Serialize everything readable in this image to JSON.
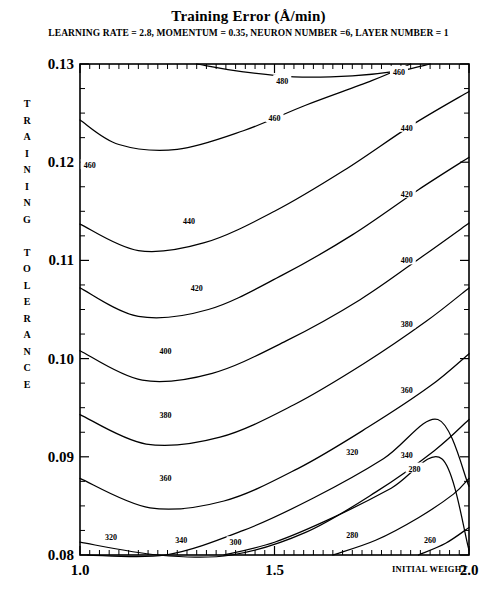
{
  "figure": {
    "title": "Training Error (Å/min)",
    "subtitle": "LEARNING RATE = 2.8, MOMENTUM = 0.35, NEURON NUMBER =6, LAYER NUMBER = 1",
    "ylabel_stacked": "T\nR\nA\nI\nN\nI\nN\nG\n \nT\nO\nL\nE\nR\nA\nN\nC\nE",
    "xaxis_name": "INITIAL WEIGHT"
  },
  "axes": {
    "x_ticklabels": [
      "1.0",
      "1.5",
      "2.0"
    ],
    "x_tickvalues": [
      1.0,
      1.5,
      2.0
    ],
    "y_ticklabels": [
      "0.08",
      "0.09",
      "0.10",
      "0.11",
      "0.12",
      "0.13"
    ],
    "y_tickvalues": [
      0.08,
      0.09,
      0.1,
      0.11,
      0.12,
      0.13
    ]
  },
  "chart_data": {
    "type": "line",
    "subtype": "contour",
    "title": "Training Error (Å/min)",
    "subtitle": "LEARNING RATE = 2.8, MOMENTUM = 0.35, NEURON NUMBER =6, LAYER NUMBER = 1",
    "xlabel": "INITIAL WEIGHT",
    "ylabel": "TRAINING TOLERANCE",
    "xlim": [
      1.0,
      2.0
    ],
    "ylim": [
      0.08,
      0.13
    ],
    "grid": false,
    "legend": "none",
    "contour_interval": 20,
    "contour_levels": [
      260,
      280,
      300,
      320,
      340,
      360,
      380,
      400,
      420,
      440,
      460,
      480
    ],
    "zunits": "Å/min",
    "contours": [
      {
        "level": 480,
        "label": "480",
        "label_xy": [
          1.52,
          0.1283
        ],
        "points": [
          [
            1.3,
            0.13
          ],
          [
            1.42,
            0.1292
          ],
          [
            1.55,
            0.1287
          ],
          [
            1.7,
            0.1288
          ],
          [
            1.82,
            0.1293
          ],
          [
            1.9,
            0.13
          ]
        ]
      },
      {
        "level": 460,
        "label_left": "460",
        "label_left_xy": [
          1.025,
          0.1197
        ],
        "label_mid": "460",
        "label_mid_xy": [
          1.5,
          0.1245
        ],
        "label_right": "460",
        "label_right_xy": [
          1.82,
          0.1292
        ],
        "points": [
          [
            1.0,
            0.1243
          ],
          [
            1.1,
            0.1218
          ],
          [
            1.25,
            0.1213
          ],
          [
            1.42,
            0.1232
          ],
          [
            1.58,
            0.1258
          ],
          [
            1.75,
            0.1283
          ],
          [
            1.85,
            0.13
          ]
        ]
      },
      {
        "level": 440,
        "label_left": "440",
        "label_left_xy": [
          1.28,
          0.114
        ],
        "label_right": "440",
        "label_right_xy": [
          1.84,
          0.1235
        ],
        "points": [
          [
            1.0,
            0.1137
          ],
          [
            1.15,
            0.111
          ],
          [
            1.32,
            0.1118
          ],
          [
            1.5,
            0.115
          ],
          [
            1.68,
            0.1192
          ],
          [
            1.85,
            0.1237
          ],
          [
            2.0,
            0.1272
          ]
        ]
      },
      {
        "level": 420,
        "label_left": "420",
        "label_left_xy": [
          1.3,
          0.1072
        ],
        "label_right": "420",
        "label_right_xy": [
          1.84,
          0.1168
        ],
        "points": [
          [
            1.0,
            0.1072
          ],
          [
            1.15,
            0.1043
          ],
          [
            1.33,
            0.105
          ],
          [
            1.52,
            0.1085
          ],
          [
            1.7,
            0.1126
          ],
          [
            1.87,
            0.1172
          ],
          [
            2.0,
            0.1205
          ]
        ]
      },
      {
        "level": 400,
        "label_left": "400",
        "label_left_xy": [
          1.22,
          0.1008
        ],
        "label_right": "400",
        "label_right_xy": [
          1.84,
          0.11
        ],
        "points": [
          [
            1.0,
            0.1008
          ],
          [
            1.16,
            0.0978
          ],
          [
            1.34,
            0.0985
          ],
          [
            1.53,
            0.1018
          ],
          [
            1.72,
            0.106
          ],
          [
            1.88,
            0.1104
          ],
          [
            2.0,
            0.1138
          ]
        ]
      },
      {
        "level": 380,
        "label_left": "380",
        "label_left_xy": [
          1.22,
          0.0943
        ],
        "label_right": "380",
        "label_right_xy": [
          1.84,
          0.1035
        ],
        "points": [
          [
            1.0,
            0.0943
          ],
          [
            1.17,
            0.0913
          ],
          [
            1.36,
            0.092
          ],
          [
            1.55,
            0.0953
          ],
          [
            1.73,
            0.0995
          ],
          [
            1.89,
            0.1038
          ],
          [
            2.0,
            0.1072
          ]
        ]
      },
      {
        "level": 360,
        "label_left": "360",
        "label_left_xy": [
          1.22,
          0.0878
        ],
        "label_right": "360",
        "label_right_xy": [
          1.84,
          0.0968
        ],
        "points": [
          [
            1.0,
            0.0878
          ],
          [
            1.18,
            0.0848
          ],
          [
            1.37,
            0.0855
          ],
          [
            1.56,
            0.0888
          ],
          [
            1.74,
            0.093
          ],
          [
            1.9,
            0.0972
          ],
          [
            2.0,
            0.1005
          ]
        ]
      },
      {
        "level": 340,
        "label_left": "340",
        "label_left_xy": [
          1.26,
          0.0815
        ],
        "label_right": "340",
        "label_right_xy": [
          1.84,
          0.0902
        ],
        "points": [
          [
            1.0,
            0.0813
          ],
          [
            1.2,
            0.0783
          ],
          [
            1.39,
            0.079
          ],
          [
            1.58,
            0.0823
          ],
          [
            1.76,
            0.0864
          ],
          [
            1.91,
            0.0906
          ],
          [
            2.0,
            0.0938
          ]
        ]
      },
      {
        "level": 320,
        "label_left": "320",
        "label_left_xy": [
          1.08,
          0.0818
        ],
        "label_right": "320",
        "label_right_xy": [
          1.7,
          0.0905
        ],
        "points": [
          [
            1.02,
            0.08
          ],
          [
            1.22,
            0.0795
          ],
          [
            1.42,
            0.0825
          ],
          [
            1.6,
            0.0858
          ],
          [
            1.78,
            0.0898
          ],
          [
            1.92,
            0.0938
          ],
          [
            2.0,
            0.087
          ]
        ]
      },
      {
        "level": 300,
        "label": "300",
        "label_xy": [
          1.4,
          0.0813
        ],
        "points": [
          [
            1.37,
            0.08
          ],
          [
            1.5,
            0.0813
          ],
          [
            1.65,
            0.0838
          ],
          [
            1.8,
            0.0868
          ],
          [
            1.93,
            0.0898
          ],
          [
            2.0,
            0.0805
          ]
        ]
      },
      {
        "level": 280,
        "label_mid": "280",
        "label_mid_xy": [
          1.7,
          0.082
        ],
        "label_right": "280",
        "label_right_xy": [
          1.86,
          0.0888
        ],
        "points": [
          [
            1.65,
            0.08
          ],
          [
            1.76,
            0.0815
          ],
          [
            1.87,
            0.0838
          ],
          [
            1.96,
            0.0862
          ],
          [
            2.0,
            0.0878
          ]
        ]
      },
      {
        "level": 260,
        "label": "260",
        "label_xy": [
          1.9,
          0.0815
        ],
        "points": [
          [
            1.87,
            0.08
          ],
          [
            1.94,
            0.0812
          ],
          [
            2.0,
            0.0828
          ]
        ]
      }
    ]
  }
}
